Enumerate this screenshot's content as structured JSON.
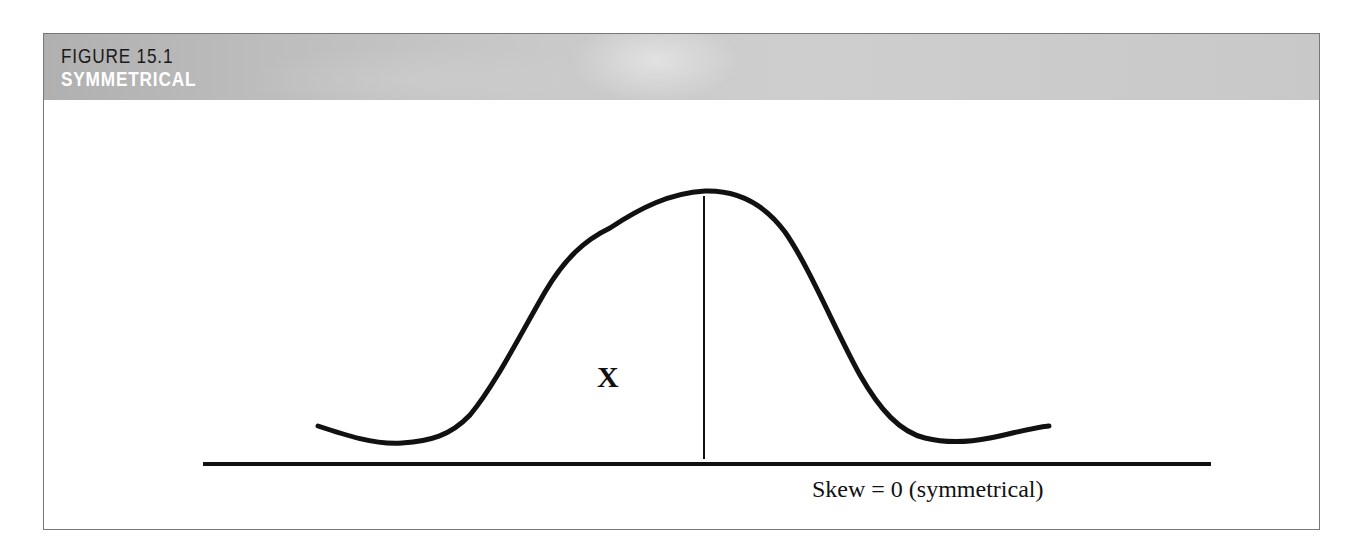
{
  "figure": {
    "number": "FIGURE 15.1",
    "title": "SYMMETRICAL"
  },
  "diagram": {
    "type": "distribution-curve",
    "curve_label": "X",
    "caption": "Skew = 0 (symmetrical)",
    "skew": 0,
    "colors": {
      "curve": "#111111",
      "axis": "#111111",
      "header_background": "#c4c4c4",
      "header_number_text": "#1a1a1a",
      "header_title_text": "#ffffff"
    }
  }
}
